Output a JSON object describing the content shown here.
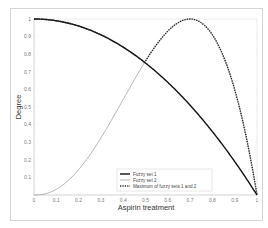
{
  "chart_data": {
    "type": "line",
    "title": "",
    "xlabel": "Aspirin treatment",
    "ylabel": "Degree",
    "xlim": [
      0,
      1
    ],
    "ylim": [
      0,
      1
    ],
    "x_ticks": [
      "0",
      "0.1",
      "0.2",
      "0.3",
      "0.4",
      "0.5",
      "0.6",
      "0.7",
      "0.8",
      "0.9",
      "1"
    ],
    "y_ticks": [
      "0.1",
      "0.2",
      "0.3",
      "0.4",
      "0.5",
      "0.6",
      "0.7",
      "0.8",
      "0.9",
      "1"
    ],
    "grid": false,
    "legend_position": "lower center",
    "x": [
      0,
      0.1,
      0.2,
      0.3,
      0.4,
      0.5,
      0.6,
      0.7,
      0.8,
      0.9,
      1.0
    ],
    "series": [
      {
        "name": "Fuzzy set 1",
        "style": "solid",
        "color": "#111111",
        "values": [
          1.0,
          0.99,
          0.96,
          0.91,
          0.84,
          0.75,
          0.64,
          0.51,
          0.36,
          0.19,
          0.0
        ]
      },
      {
        "name": "Fuzzy set 2",
        "style": "solid",
        "color": "#aaaaaa",
        "values": [
          0.0,
          0.03,
          0.15,
          0.32,
          0.52,
          0.75,
          0.91,
          1.0,
          0.9,
          0.55,
          0.0
        ]
      },
      {
        "name": "Maximum of fuzzy sets 1 and 2",
        "style": "dotted",
        "color": "#222222",
        "values": [
          1.0,
          0.99,
          0.96,
          0.91,
          0.84,
          0.75,
          0.91,
          1.0,
          0.9,
          0.55,
          0.0
        ]
      }
    ]
  },
  "legend": {
    "items": [
      "Fuzzy set 1",
      "Fuzzy set 2",
      "Maximum of fuzzy sets 1 and 2"
    ]
  },
  "axes": {
    "xlabel": "Aspirin treatment",
    "ylabel": "Degree"
  }
}
